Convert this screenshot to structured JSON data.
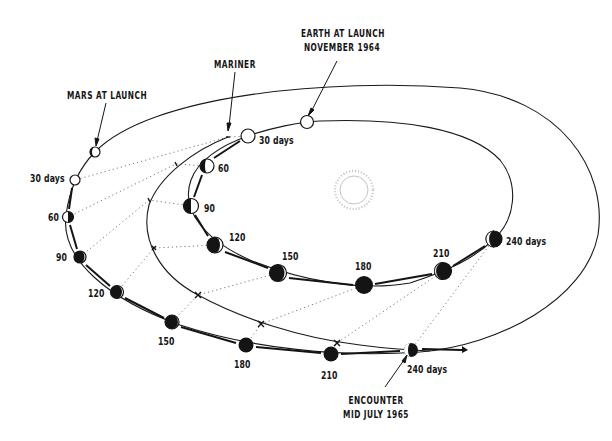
{
  "diagram": {
    "colors": {
      "ink": "#141414",
      "paper": "#ffffff",
      "sun": "#b5b5b5"
    },
    "annotations": {
      "earth_at_launch": [
        "EARTH AT LAUNCH",
        "NOVEMBER 1964"
      ],
      "mariner": "MARINER",
      "mars_at_launch": "MARS AT LAUNCH",
      "encounter": [
        "ENCOUNTER",
        "MID JULY 1965"
      ]
    },
    "earth_positions": [
      {
        "label": "30 days",
        "x": 248,
        "y": 136
      },
      {
        "label": "60",
        "x": 207,
        "y": 166
      },
      {
        "label": "90",
        "x": 191,
        "y": 206
      },
      {
        "label": "120",
        "x": 215,
        "y": 245
      },
      {
        "label": "150",
        "x": 278,
        "y": 273
      },
      {
        "label": "180",
        "x": 364,
        "y": 285
      },
      {
        "label": "210",
        "x": 443,
        "y": 271
      },
      {
        "label": "240 days",
        "x": 494,
        "y": 239
      }
    ],
    "mars_positions": [
      {
        "label": "30 days",
        "x": 75,
        "y": 180
      },
      {
        "label": "60",
        "x": 68,
        "y": 217
      },
      {
        "label": "90",
        "x": 80,
        "y": 257
      },
      {
        "label": "120",
        "x": 117,
        "y": 292
      },
      {
        "label": "150",
        "x": 172,
        "y": 322
      },
      {
        "label": "180",
        "x": 246,
        "y": 345
      },
      {
        "label": "210",
        "x": 331,
        "y": 354
      },
      {
        "label": "240 days",
        "x": 411,
        "y": 350
      }
    ],
    "mars_at_launch_pos": {
      "x": 95,
      "y": 152
    },
    "earth_at_launch_pos": {
      "x": 307,
      "y": 122
    },
    "mariner_positions": [
      {
        "x": 228,
        "y": 137
      },
      {
        "x": 176,
        "y": 164
      },
      {
        "x": 149,
        "y": 200
      },
      {
        "x": 154,
        "y": 248
      },
      {
        "x": 198,
        "y": 295
      },
      {
        "x": 261,
        "y": 324
      },
      {
        "x": 337,
        "y": 343
      },
      {
        "x": 411,
        "y": 350
      }
    ],
    "sun": {
      "x": 354,
      "y": 190
    }
  }
}
